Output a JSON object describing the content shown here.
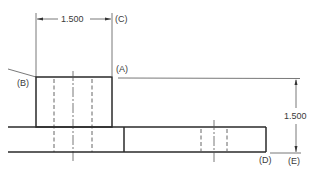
{
  "drawing": {
    "type": "engineering-orthographic-view",
    "dimensions": {
      "horizontal": {
        "value": "1.500",
        "label": "(C)"
      },
      "vertical": {
        "value": "1.500",
        "label": "(E)"
      }
    },
    "callouts": {
      "a": "(A)",
      "b": "(B)",
      "c": "(C)",
      "d": "(D)",
      "e": "(E)"
    },
    "colors": {
      "line": "#2a2a2a",
      "thin": "#555555",
      "text": "#3a3a3a",
      "background": "#ffffff"
    }
  }
}
